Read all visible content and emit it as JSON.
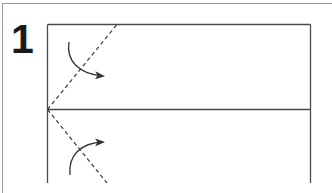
{
  "step": {
    "number": "1"
  },
  "diagram": {
    "type": "folding-instruction",
    "paper": {
      "x": 47,
      "y": 24,
      "right": 310,
      "middle_line_y": 109
    },
    "fold_lines": [
      {
        "name": "upper-diagonal-fold",
        "style": "dashed",
        "from": [
          47,
          109
        ],
        "to": [
          117,
          24
        ]
      },
      {
        "name": "lower-diagonal-fold",
        "style": "dashed",
        "from": [
          47,
          109
        ],
        "to": [
          107,
          183
        ]
      }
    ],
    "arrows": [
      {
        "name": "upper-fold-arrow",
        "direction": "down-right"
      },
      {
        "name": "lower-fold-arrow",
        "direction": "up-right"
      }
    ],
    "colors": {
      "line": "#4a4a4a",
      "frame": "#9a9a9a",
      "numeral": "#1a1a1a",
      "background": "#ffffff"
    }
  }
}
